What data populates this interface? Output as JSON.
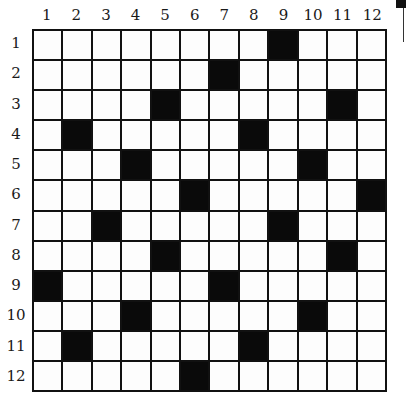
{
  "grid": {
    "rows": 12,
    "cols": 12,
    "column_labels": [
      "1",
      "2",
      "3",
      "4",
      "5",
      "6",
      "7",
      "8",
      "9",
      "10",
      "11",
      "12"
    ],
    "row_labels": [
      "1",
      "2",
      "3",
      "4",
      "5",
      "6",
      "7",
      "8",
      "9",
      "10",
      "11",
      "12"
    ],
    "black_cells": [
      [
        1,
        9
      ],
      [
        2,
        7
      ],
      [
        3,
        5
      ],
      [
        3,
        11
      ],
      [
        4,
        2
      ],
      [
        4,
        8
      ],
      [
        5,
        4
      ],
      [
        5,
        10
      ],
      [
        6,
        6
      ],
      [
        6,
        12
      ],
      [
        7,
        3
      ],
      [
        7,
        9
      ],
      [
        8,
        5
      ],
      [
        8,
        11
      ],
      [
        9,
        1
      ],
      [
        9,
        7
      ],
      [
        10,
        4
      ],
      [
        10,
        10
      ],
      [
        11,
        2
      ],
      [
        11,
        8
      ],
      [
        12,
        6
      ]
    ],
    "colors": {
      "black": "#0a0a0a",
      "white": "#fdfdfd",
      "line": "#111111"
    }
  }
}
